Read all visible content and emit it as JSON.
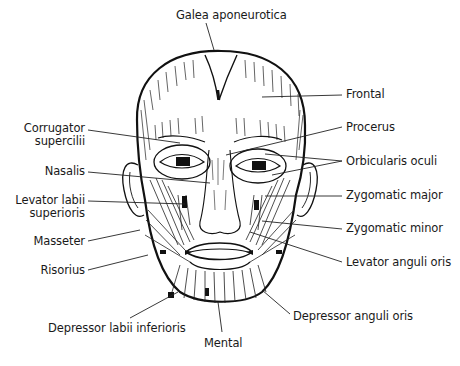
{
  "diagram": {
    "type": "anatomical-illustration",
    "labels": {
      "galea": {
        "text": "Galea aponeurotica",
        "x": 176,
        "y": 9,
        "line": [
          [
            206,
            25
          ],
          [
            214,
            52
          ]
        ]
      },
      "frontal": {
        "text": "Frontal",
        "x": 346,
        "y": 88,
        "line": [
          [
            342,
            95
          ],
          [
            262,
            97
          ]
        ]
      },
      "procerus": {
        "text": "Procerus",
        "x": 346,
        "y": 121,
        "line": [
          [
            342,
            127
          ],
          [
            226,
            155
          ]
        ]
      },
      "orbicularis": {
        "text": "Orbicularis oculi",
        "x": 346,
        "y": 155,
        "line": [
          [
            342,
            161
          ],
          [
            265,
            154
          ]
        ],
        "line2": [
          [
            342,
            161
          ],
          [
            272,
            175
          ]
        ]
      },
      "zygomatic_major": {
        "text": "Zygomatic major",
        "x": 346,
        "y": 188,
        "line": [
          [
            342,
            196
          ],
          [
            265,
            196
          ]
        ]
      },
      "zygomatic_minor": {
        "text": "Zygomatic minor",
        "x": 346,
        "y": 222,
        "line": [
          [
            342,
            229
          ],
          [
            260,
            220
          ]
        ]
      },
      "levator_anguli": {
        "text": "Levator anguli oris",
        "x": 346,
        "y": 256,
        "line": [
          [
            342,
            262
          ],
          [
            250,
            232
          ]
        ]
      },
      "depressor_anguli": {
        "text": "Depressor anguli oris",
        "x": 292,
        "y": 310,
        "line": [
          [
            290,
            316
          ],
          [
            262,
            290
          ]
        ]
      },
      "mental": {
        "text": "Mental",
        "x": 205,
        "y": 340,
        "line": [
          [
            222,
            332
          ],
          [
            218,
            300
          ]
        ]
      },
      "depressor_labii": {
        "text": "Depressor labii inferioris",
        "x": 48,
        "y": 322,
        "line": [
          [
            130,
            318
          ],
          [
            178,
            290
          ]
        ]
      },
      "risorius": {
        "text": "Risorius",
        "x": 45,
        "y": 263,
        "line": [
          [
            88,
            270
          ],
          [
            148,
            255
          ]
        ]
      },
      "masseter": {
        "text": "Masseter",
        "x": 38,
        "y": 234,
        "line": [
          [
            88,
            240
          ],
          [
            140,
            228
          ]
        ]
      },
      "levator_labii": {
        "lines": [
          "Levator labii",
          "superioris"
        ],
        "x": 12,
        "y": 193,
        "line": [
          [
            88,
            200
          ],
          [
            185,
            203
          ]
        ]
      },
      "nasalis": {
        "text": "Nasalis",
        "x": 45,
        "y": 165,
        "line": [
          [
            88,
            172
          ],
          [
            210,
            182
          ]
        ]
      },
      "corrugator": {
        "lines": [
          "Corrugator",
          "supercilii"
        ],
        "x": 25,
        "y": 120,
        "line": [
          [
            88,
            130
          ],
          [
            180,
            143
          ]
        ]
      }
    }
  }
}
